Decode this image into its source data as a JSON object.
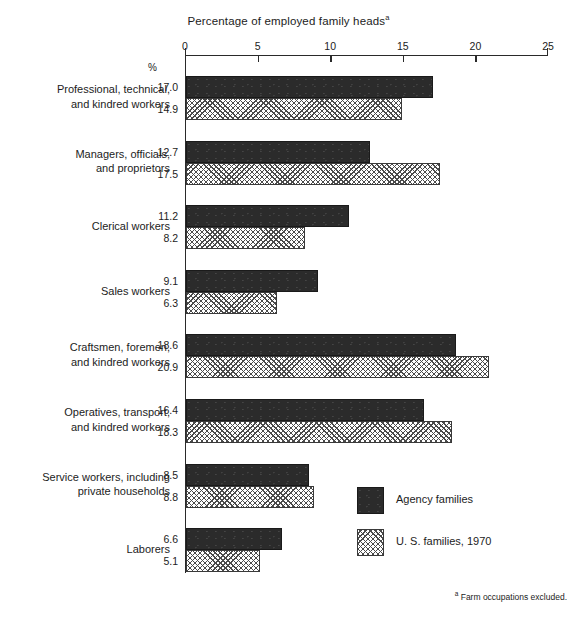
{
  "chart_data": {
    "type": "bar",
    "orientation": "horizontal",
    "title": "Percentage of employed family heads",
    "title_footnote_marker": "a",
    "xlabel": "",
    "ylabel": "",
    "xlim": [
      0,
      25
    ],
    "xticks": [
      0,
      5,
      10,
      15,
      20,
      25
    ],
    "xticklabels": [
      "0",
      "5",
      "10",
      "15",
      "20",
      "25"
    ],
    "grid": false,
    "unit_symbol": "%",
    "legend_position": "inside-right-lower",
    "categories": [
      "Professional, technical,\nand kindred workers",
      "Managers, officials,\nand proprietors",
      "Clerical workers",
      "Sales workers",
      "Craftsmen, foremen,\nand kindred workers",
      "Operatives, transport,\nand kindred workers",
      "Service workers, including\nprivate households",
      "Laborers"
    ],
    "series": [
      {
        "name": "Agency families",
        "fill": "solid-dark",
        "values": [
          17.0,
          12.7,
          11.2,
          9.1,
          18.6,
          16.4,
          8.5,
          6.6
        ]
      },
      {
        "name": "U. S. families, 1970",
        "fill": "cross-hatch",
        "values": [
          14.9,
          17.5,
          8.2,
          6.3,
          20.9,
          18.3,
          8.8,
          5.1
        ]
      }
    ],
    "footnote": "Farm occupations excluded.",
    "footnote_marker": "a"
  },
  "chart": {
    "title": "Percentage of employed family heads",
    "title_marker": "a",
    "percent_symbol": "%",
    "footnote": "Farm occupations excluded.",
    "footnote_marker": "a"
  },
  "axis": {
    "ticks": [
      {
        "label": "0",
        "value": 0
      },
      {
        "label": "5",
        "value": 5
      },
      {
        "label": "10",
        "value": 10
      },
      {
        "label": "15",
        "value": 15
      },
      {
        "label": "20",
        "value": 20
      },
      {
        "label": "25",
        "value": 25
      }
    ]
  },
  "groups": [
    {
      "label_line1": "Professional, technical,",
      "label_line2": "and kindred workers",
      "dark_value": "17.0",
      "hatch_value": "14.9"
    },
    {
      "label_line1": "Managers, officials,",
      "label_line2": "and proprietors",
      "dark_value": "12.7",
      "hatch_value": "17.5"
    },
    {
      "label_line1": "Clerical workers",
      "label_line2": "",
      "dark_value": "11.2",
      "hatch_value": "8.2"
    },
    {
      "label_line1": "Sales workers",
      "label_line2": "",
      "dark_value": "9.1",
      "hatch_value": "6.3"
    },
    {
      "label_line1": "Craftsmen, foremen,",
      "label_line2": "and kindred workers",
      "dark_value": "18.6",
      "hatch_value": "20.9"
    },
    {
      "label_line1": "Operatives, transport,",
      "label_line2": "and kindred workers",
      "dark_value": "16.4",
      "hatch_value": "18.3"
    },
    {
      "label_line1": "Service workers, including",
      "label_line2": "private households",
      "dark_value": "8.5",
      "hatch_value": "8.8"
    },
    {
      "label_line1": "Laborers",
      "label_line2": "",
      "dark_value": "6.6",
      "hatch_value": "5.1"
    }
  ],
  "legend": {
    "items": [
      {
        "label": "Agency families",
        "swatch": "solid-dark-swatch"
      },
      {
        "label": "U. S. families, 1970",
        "swatch": "cross-hatch-swatch"
      }
    ]
  }
}
